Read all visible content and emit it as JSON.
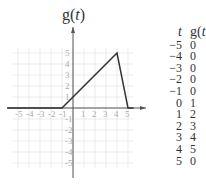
{
  "chart_data": {
    "type": "line",
    "title": "g(t)",
    "xlabel": "t",
    "ylabel": "g(t)",
    "xlim": [
      -5,
      5
    ],
    "ylim": [
      -5,
      5
    ],
    "grid": true,
    "x_ticks": [
      -5,
      -4,
      -3,
      -2,
      -1,
      1,
      2,
      3,
      4,
      5
    ],
    "y_ticks": [
      -5,
      -4,
      -3,
      -2,
      -1,
      1,
      2,
      3,
      4,
      5
    ],
    "x": [
      -6,
      -1,
      4,
      5,
      5.5
    ],
    "y": [
      0,
      0,
      5,
      0,
      0
    ],
    "table": {
      "headers": [
        "t",
        "g(t)"
      ],
      "rows": [
        [
          -5,
          0
        ],
        [
          -4,
          0
        ],
        [
          -3,
          0
        ],
        [
          -2,
          0
        ],
        [
          -1,
          0
        ],
        [
          0,
          1
        ],
        [
          1,
          2
        ],
        [
          2,
          3
        ],
        [
          3,
          4
        ],
        [
          4,
          5
        ],
        [
          5,
          0
        ]
      ]
    }
  },
  "labels": {
    "y_axis": "g(t)",
    "table_t": "t",
    "table_g": "g(t)",
    "arrow_t": "t"
  }
}
